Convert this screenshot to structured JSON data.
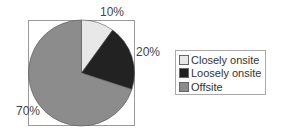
{
  "chart_data": {
    "type": "pie",
    "title": "",
    "categories": [
      "Closely onsite",
      "Loosely onsite",
      "Offsite"
    ],
    "values": [
      10,
      20,
      70
    ],
    "data_labels": [
      "10%",
      "20%",
      "70%"
    ],
    "colors": [
      "#e8e8e8",
      "#222222",
      "#8c8c8c"
    ],
    "legend_position": "right"
  },
  "labels": {
    "closely": "10%",
    "loosely": "20%",
    "offsite": "70%"
  },
  "legend": {
    "items": [
      {
        "label": "Closely onsite",
        "color": "#e8e8e8"
      },
      {
        "label": "Loosely onsite",
        "color": "#222222"
      },
      {
        "label": "Offsite",
        "color": "#8c8c8c"
      }
    ]
  }
}
